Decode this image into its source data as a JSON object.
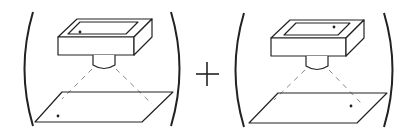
{
  "diagram": {
    "operator": "+",
    "colors": {
      "stroke": "#222222",
      "dash": "#888888",
      "background": "#ffffff"
    },
    "panels": [
      {
        "id": "left",
        "source_dot": "bottom-left of projector window",
        "target_dot": "bottom-left of projection plane"
      },
      {
        "id": "right",
        "source_dot": "top-right of projector window",
        "target_dot": "right side of projection plane"
      }
    ]
  }
}
